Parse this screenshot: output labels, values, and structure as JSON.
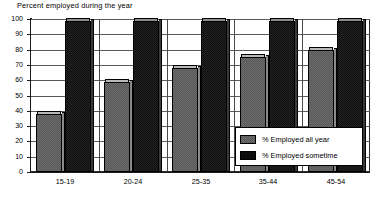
{
  "chart_data": {
    "type": "bar",
    "title": "Percent employed during the year",
    "xlabel": "",
    "ylabel": "",
    "ylim": [
      0,
      100
    ],
    "yticks": [
      0,
      10,
      20,
      30,
      40,
      50,
      60,
      70,
      80,
      90,
      100
    ],
    "grid": true,
    "legend_position": "bottom-right-inside",
    "categories": [
      "15-19",
      "20-24",
      "25-35",
      "35-44",
      "45-54"
    ],
    "series": [
      {
        "name": "% Employed all year",
        "color": "#6e6e6e",
        "values": [
          38,
          59,
          68,
          75,
          80
        ]
      },
      {
        "name": "% Employed sometime",
        "color": "#0d0d0d",
        "values": [
          99,
          99,
          99,
          99,
          99
        ]
      }
    ]
  },
  "legend": {
    "items": [
      {
        "label": "% Employed all year",
        "swatch": "gray"
      },
      {
        "label": "% Employed sometime",
        "swatch": "black"
      }
    ]
  }
}
